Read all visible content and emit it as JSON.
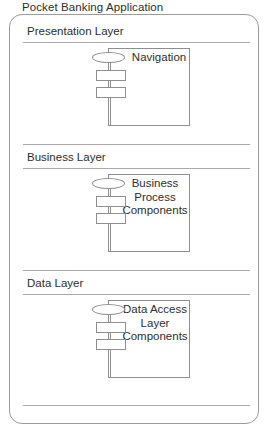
{
  "diagram": {
    "type": "layered-architecture",
    "title": "Pocket Banking Application",
    "stroke_color": "#8e8e8e",
    "text_color": "#2e2e2e",
    "background": "#ffffff",
    "layers": [
      {
        "id": "presentation",
        "name": "Presentation Layer",
        "component": {
          "name": "Navigation",
          "lines": [
            "Navigation"
          ],
          "icon": "uml-component-icon"
        }
      },
      {
        "id": "business",
        "name": "Business Layer",
        "component": {
          "name": "Business Process Components",
          "lines": [
            "Business",
            "Process",
            "Components"
          ],
          "icon": "uml-component-icon"
        }
      },
      {
        "id": "data",
        "name": "Data Layer",
        "component": {
          "name": "Data Access Layer Components",
          "lines": [
            "Data Access",
            "Layer",
            "Components"
          ],
          "icon": "uml-component-icon"
        }
      }
    ]
  }
}
